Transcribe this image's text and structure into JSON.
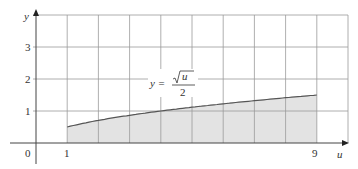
{
  "chart_data": {
    "type": "area",
    "title": "",
    "xlabel": "u",
    "ylabel": "y",
    "x_ticks_labeled": [
      "0",
      "1",
      "9"
    ],
    "y_ticks_labeled": [
      "1",
      "2",
      "3"
    ],
    "xlim": [
      0,
      10
    ],
    "ylim": [
      -0.6,
      4
    ],
    "grid": true,
    "grid_x_step": 1,
    "grid_y_step": 1,
    "legend": "none",
    "annotation": {
      "lhs": "y =",
      "numerator": "u",
      "denominator": "2",
      "text": "y = √u / 2"
    },
    "series": [
      {
        "name": "y = sqrt(u)/2",
        "x": [
          1,
          2,
          3,
          4,
          5,
          6,
          7,
          8,
          9
        ],
        "values": [
          0.5,
          0.707,
          0.866,
          1.0,
          1.118,
          1.225,
          1.323,
          1.414,
          1.5
        ],
        "shaded_region": {
          "from": 1,
          "to": 9,
          "color": "#e3e3e3"
        },
        "line_color": "#555555"
      }
    ]
  },
  "labels": {
    "y_axis": "y",
    "x_axis": "u",
    "origin": "0",
    "x1": "1",
    "x9": "9",
    "y1": "1",
    "y2": "2",
    "y3": "3",
    "eq_lhs": "y =",
    "eq_num": "u",
    "eq_den": "2"
  }
}
